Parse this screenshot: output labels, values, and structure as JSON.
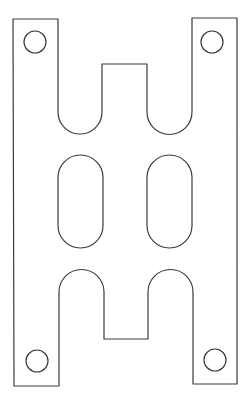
{
  "diagram": {
    "type": "cad-plate-outline",
    "canvas": {
      "width": 251,
      "height": 401,
      "background": "#ffffff"
    },
    "stroke_color": "#3a3a3a",
    "outline_path": "M13,19 L58,19 L58,112 A22,22 0 0 0 102,112 L102,64 L147,64 L147,112 A22.5,22.5 0 0 0 192,112 L192,18 L237,18 L237,384 L193,384 L193,292 A22.5,22.5 0 0 0 148,292 L148,339 L104,339 L104,292 A22.5,22.5 0 0 0 59,292 L59,386 L14,386 Z",
    "mounting_holes": [
      {
        "name": "hole-top-left",
        "cx": 35,
        "cy": 42,
        "r": 11
      },
      {
        "name": "hole-top-right",
        "cx": 212,
        "cy": 42,
        "r": 11
      },
      {
        "name": "hole-bottom-left",
        "cx": 37,
        "cy": 361,
        "r": 11
      },
      {
        "name": "hole-bottom-right",
        "cx": 215,
        "cy": 360,
        "r": 11
      }
    ],
    "slots": [
      {
        "name": "slot-left",
        "x": 58,
        "y": 155,
        "width": 45,
        "height": 93,
        "rx": 22.5
      },
      {
        "name": "slot-right",
        "x": 147,
        "y": 155,
        "width": 45,
        "height": 93,
        "rx": 22.5
      }
    ]
  }
}
